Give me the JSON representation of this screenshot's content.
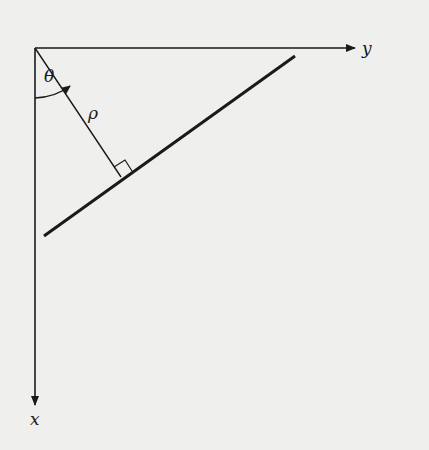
{
  "diagram": {
    "type": "normal-form line parametrization",
    "labels": {
      "x_axis": "x",
      "y_axis": "y",
      "angle": "θ",
      "distance": "ρ"
    },
    "colors": {
      "background": "#efefed",
      "ink": "#1a1a1a"
    }
  }
}
